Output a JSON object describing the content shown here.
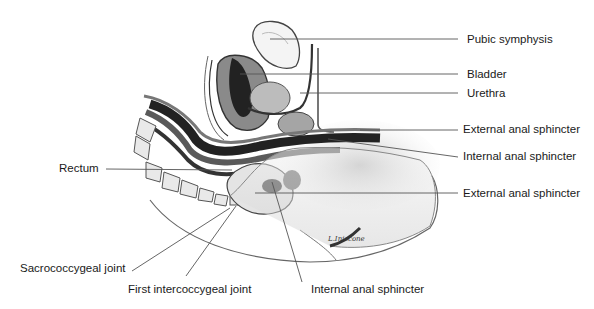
{
  "figure": {
    "type": "anatomical-illustration",
    "signature": "L.Iniscone",
    "colors": {
      "background": "#ffffff",
      "ink": "#1a1a1a",
      "leader_line": "#555555",
      "dark_tissue": "#2b2b2b",
      "mid_tissue": "#7a7a7a",
      "light_tissue": "#d8d8d8"
    }
  },
  "labels": {
    "right": [
      {
        "id": "pubic-symphysis",
        "text": "Pubic symphysis"
      },
      {
        "id": "bladder",
        "text": "Bladder"
      },
      {
        "id": "urethra",
        "text": "Urethra"
      },
      {
        "id": "external-anal-sphincter-upper",
        "text": "External anal sphincter"
      },
      {
        "id": "internal-anal-sphincter-upper",
        "text": "Internal anal sphincter"
      },
      {
        "id": "external-anal-sphincter-lower",
        "text": "External anal sphincter"
      }
    ],
    "left": [
      {
        "id": "rectum",
        "text": "Rectum"
      },
      {
        "id": "sacrococcygeal-joint",
        "text": "Sacrococcygeal joint"
      }
    ],
    "bottom": [
      {
        "id": "first-intercoccygeal-joint",
        "text": "First intercoccygeal joint"
      },
      {
        "id": "internal-anal-sphincter-lower",
        "text": "Internal anal sphincter"
      }
    ]
  }
}
